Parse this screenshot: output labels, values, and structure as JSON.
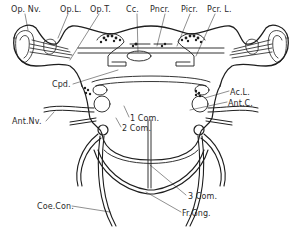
{
  "diagram": {
    "type": "anatomical-illustration",
    "colors": {
      "ink": "#1e1e1e",
      "background": "#ffffff",
      "label": "#2a2a2a"
    },
    "labels": [
      {
        "id": "op_nv",
        "text": "Op. Nv.",
        "x": 11,
        "y": 5
      },
      {
        "id": "op_l",
        "text": "Op.L.",
        "x": 60,
        "y": 5
      },
      {
        "id": "op_t",
        "text": "Op.T.",
        "x": 90,
        "y": 5
      },
      {
        "id": "cc",
        "text": "Cc.",
        "x": 126,
        "y": 5
      },
      {
        "id": "pncr",
        "text": "Pncr.",
        "x": 150,
        "y": 5
      },
      {
        "id": "picr",
        "text": "Picr.",
        "x": 181,
        "y": 5
      },
      {
        "id": "pcr_l",
        "text": "Pcr. L.",
        "x": 207,
        "y": 5
      },
      {
        "id": "cpd",
        "text": "Cpd.",
        "x": 52,
        "y": 80
      },
      {
        "id": "ac_l",
        "text": "Ac.L.",
        "x": 230,
        "y": 88
      },
      {
        "id": "ant_c",
        "text": "Ant.C.",
        "x": 228,
        "y": 99
      },
      {
        "id": "ant_nv",
        "text": "Ant.Nv.",
        "x": 12,
        "y": 117
      },
      {
        "id": "com1",
        "text": "1 Com.",
        "x": 130,
        "y": 114
      },
      {
        "id": "com2",
        "text": "2 Com.",
        "x": 122,
        "y": 124
      },
      {
        "id": "com3",
        "text": "3 Com.",
        "x": 188,
        "y": 192
      },
      {
        "id": "fr_gng",
        "text": "Fr.Gng.",
        "x": 182,
        "y": 209
      },
      {
        "id": "coe_con",
        "text": "Coe.Con.",
        "x": 37,
        "y": 202
      }
    ]
  }
}
